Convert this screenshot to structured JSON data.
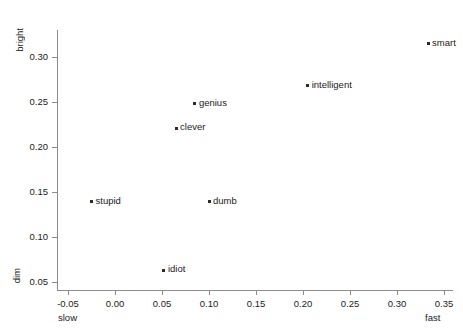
{
  "chart_data": {
    "type": "scatter",
    "title": "",
    "xlabel": "",
    "ylabel": "",
    "grid": false,
    "legend": "none",
    "xlim": [
      -0.065,
      0.36
    ],
    "ylim": [
      0.035,
      0.335
    ],
    "axis_end_labels": {
      "x_low": "slow",
      "x_high": "fast",
      "y_low": "dim",
      "y_high": "bright"
    },
    "xticks": [
      -0.05,
      0.0,
      0.05,
      0.1,
      0.15,
      0.2,
      0.25,
      0.3,
      0.35
    ],
    "xticklabels": [
      "-0.05",
      "0.00",
      "0.05",
      "0.10",
      "0.15",
      "0.20",
      "0.25",
      "0.30",
      "0.35"
    ],
    "yticks": [
      0.05,
      0.1,
      0.15,
      0.2,
      0.25,
      0.3
    ],
    "yticklabels": [
      "0.05",
      "0.10",
      "0.15",
      "0.20",
      "0.25",
      "0.30"
    ],
    "marker_color": "#2b2b2b",
    "axis_color": "#8c8c8c",
    "points": [
      {
        "label": "smart",
        "x": 0.333,
        "y": 0.315
      },
      {
        "label": "intelligent",
        "x": 0.205,
        "y": 0.268
      },
      {
        "label": "genius",
        "x": 0.085,
        "y": 0.248
      },
      {
        "label": "clever",
        "x": 0.065,
        "y": 0.221
      },
      {
        "label": "dumb",
        "x": 0.1,
        "y": 0.139
      },
      {
        "label": "stupid",
        "x": -0.025,
        "y": 0.139
      },
      {
        "label": "idiot",
        "x": 0.052,
        "y": 0.063
      }
    ]
  }
}
